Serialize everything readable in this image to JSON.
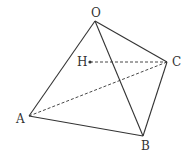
{
  "diagram": {
    "type": "tetrahedron",
    "stroke_color": "#333333",
    "background": "#ffffff",
    "vertices": {
      "O": {
        "label": "O",
        "x": 95,
        "y": 21
      },
      "A": {
        "label": "A",
        "x": 29,
        "y": 116
      },
      "B": {
        "label": "B",
        "x": 143,
        "y": 136
      },
      "C": {
        "label": "C",
        "x": 167,
        "y": 62
      },
      "H": {
        "label": "H",
        "x": 90,
        "y": 62
      }
    },
    "solid_edges": [
      "OA",
      "OB",
      "OC",
      "AB",
      "BC"
    ],
    "dashed_edges": [
      "AC",
      "HC"
    ],
    "points": [
      "H"
    ]
  }
}
